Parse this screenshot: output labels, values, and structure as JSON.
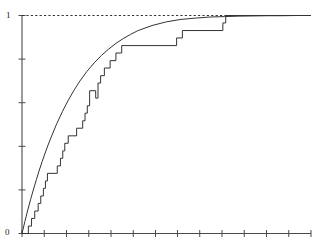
{
  "chart_data": {
    "type": "line",
    "title": "",
    "subtitle": "",
    "xlabel": "",
    "ylabel": "",
    "xlim": [
      0,
      10
    ],
    "ylim": [
      0,
      1.0
    ],
    "grid": false,
    "legend": null,
    "y_tick_labels": [
      "0",
      "1"
    ],
    "y_ticks": [
      0,
      0.2,
      0.4,
      0.6,
      0.8,
      1.0
    ],
    "x_tick_labels": [],
    "x_ticks": [
      0,
      0.77,
      1.54,
      2.31,
      3.08,
      3.85,
      4.62,
      5.38,
      6.15,
      6.92,
      7.69,
      8.46,
      9.23,
      10.0
    ],
    "reference_line": {
      "name": "unit-reference",
      "orientation": "horizontal",
      "y": 1.0,
      "style": "dotted",
      "color": "#333333"
    },
    "series": [
      {
        "name": "theoretical-cdf",
        "label": "Theoretical CDF",
        "type": "line",
        "style": "solid",
        "color": "#333333",
        "points": [
          [
            0.0,
            0.0
          ],
          [
            0.1,
            0.055
          ],
          [
            0.2,
            0.108
          ],
          [
            0.3,
            0.157
          ],
          [
            0.4,
            0.204
          ],
          [
            0.5,
            0.248
          ],
          [
            0.6,
            0.291
          ],
          [
            0.7,
            0.331
          ],
          [
            0.8,
            0.369
          ],
          [
            0.9,
            0.405
          ],
          [
            1.0,
            0.439
          ],
          [
            1.2,
            0.503
          ],
          [
            1.4,
            0.56
          ],
          [
            1.6,
            0.611
          ],
          [
            1.8,
            0.657
          ],
          [
            2.0,
            0.699
          ],
          [
            2.25,
            0.744
          ],
          [
            2.5,
            0.783
          ],
          [
            2.75,
            0.817
          ],
          [
            3.0,
            0.846
          ],
          [
            3.25,
            0.872
          ],
          [
            3.5,
            0.894
          ],
          [
            3.75,
            0.913
          ],
          [
            4.0,
            0.93
          ],
          [
            4.5,
            0.954
          ],
          [
            5.0,
            0.971
          ],
          [
            5.5,
            0.982
          ],
          [
            6.0,
            0.988
          ],
          [
            6.5,
            0.993
          ],
          [
            7.0,
            0.995
          ],
          [
            7.5,
            0.997
          ],
          [
            8.0,
            0.998
          ],
          [
            8.5,
            0.999
          ],
          [
            9.0,
            0.999
          ],
          [
            9.5,
            1.0
          ],
          [
            10.0,
            1.0
          ]
        ]
      },
      {
        "name": "empirical-cdf",
        "label": "Empirical CDF",
        "type": "step",
        "style": "solid",
        "color": "#333333",
        "jump_points": [
          [
            0.22,
            0.0
          ],
          [
            0.22,
            0.034
          ],
          [
            0.33,
            0.069
          ],
          [
            0.44,
            0.103
          ],
          [
            0.56,
            0.138
          ],
          [
            0.65,
            0.172
          ],
          [
            0.74,
            0.207
          ],
          [
            0.81,
            0.241
          ],
          [
            0.88,
            0.276
          ],
          [
            1.22,
            0.31
          ],
          [
            1.33,
            0.345
          ],
          [
            1.41,
            0.379
          ],
          [
            1.48,
            0.414
          ],
          [
            1.6,
            0.448
          ],
          [
            1.89,
            0.483
          ],
          [
            2.1,
            0.517
          ],
          [
            2.18,
            0.552
          ],
          [
            2.26,
            0.586
          ],
          [
            2.34,
            0.655
          ],
          [
            2.55,
            0.621
          ],
          [
            2.63,
            0.69
          ],
          [
            2.72,
            0.724
          ],
          [
            2.85,
            0.759
          ],
          [
            3.05,
            0.793
          ],
          [
            3.25,
            0.828
          ],
          [
            3.45,
            0.862
          ],
          [
            5.35,
            0.897
          ],
          [
            5.55,
            0.931
          ],
          [
            6.95,
            0.966
          ],
          [
            7.05,
            1.0
          ],
          [
            10.0,
            1.0
          ]
        ]
      }
    ],
    "annotations": []
  },
  "labels": {
    "y_top": "1",
    "y_bottom": "0"
  }
}
